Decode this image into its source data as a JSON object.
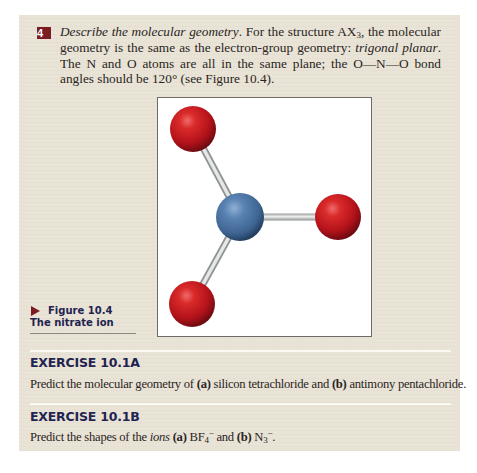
{
  "step": {
    "number": "4",
    "lead_italic": "Describe the molecular geometry",
    "text_1": ". For the structure AX",
    "sub_3": "3",
    "text_2": ", the molecular geometry is the same as the electron-group geometry: ",
    "italic_2": "trigonal planar",
    "text_3": ". The N and O atoms are all in the same plane; the O—N—O bond angles should be 120° (see Figure 10.4)."
  },
  "figure": {
    "number": "Figure 10.4",
    "title": "The nitrate ion",
    "molecule": {
      "central_atom": {
        "element": "N",
        "color": "#4a6f9c"
      },
      "outer_atoms": [
        {
          "element": "O",
          "position": "upper-left",
          "color": "#c4141b"
        },
        {
          "element": "O",
          "position": "right",
          "color": "#c4141b"
        },
        {
          "element": "O",
          "position": "lower-left",
          "color": "#c4141b"
        }
      ],
      "bond_color": "#c9cbcb",
      "geometry": "trigonal planar"
    }
  },
  "exercises": [
    {
      "heading": "EXERCISE 10.1A",
      "prefix": "Predict the molecular geometry of ",
      "label_a": "(a)",
      "mid": " silicon tetrachloride and ",
      "label_b": "(b)",
      "suffix": " antimony pentachloride."
    },
    {
      "heading": "EXERCISE 10.1B",
      "prefix": "Predict the shapes of the ",
      "italic": "ions",
      "space": " ",
      "label_a": "(a)",
      "formula_a": " BF",
      "formula_a_sub": "4",
      "formula_a_sup": "−",
      "mid": " and ",
      "label_b": "(b)",
      "formula_b": " N",
      "formula_b_sub": "3",
      "formula_b_sup": "−",
      "suffix": "."
    }
  ],
  "colors": {
    "panel_background": "#e9e3d6",
    "badge": "#7b1c22",
    "heading_navy": "#1f2450",
    "body_text": "#2a2522"
  }
}
